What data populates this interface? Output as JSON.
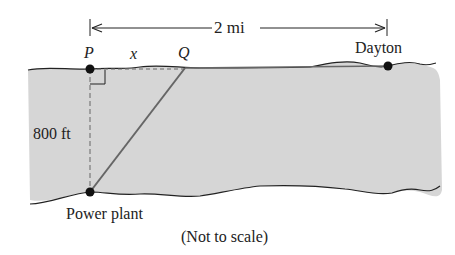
{
  "diagram": {
    "distance_label": "2 mi",
    "point_p": "P",
    "point_q": "Q",
    "segment_label": "x",
    "town_label": "Dayton",
    "depth_label": "800 ft",
    "plant_label": "Power plant",
    "note": "(Not to scale)",
    "colors": {
      "river": "#d6d6d6",
      "line": "#777777",
      "ink": "#222222"
    }
  }
}
